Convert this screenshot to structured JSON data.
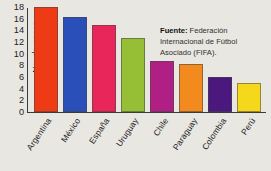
{
  "chart_data": {
    "type": "bar",
    "title": "",
    "xlabel": "",
    "ylabel": "No. de veces",
    "ylim": [
      0,
      18
    ],
    "yticks": [
      "0",
      "2",
      "4",
      "6",
      "8",
      "10",
      "12",
      "14",
      "16",
      "18"
    ],
    "grid": false,
    "legend": "none",
    "categories": [
      "Argentina",
      "México",
      "España",
      "Uruguay",
      "Chile",
      "Paraguay",
      "Colombia",
      "Perú"
    ],
    "values": [
      18,
      16.3,
      15,
      12.7,
      8.7,
      8.3,
      6,
      5
    ],
    "colors": [
      "#ef3a16",
      "#2a4fb8",
      "#e8265a",
      "#97bf35",
      "#b02084",
      "#f28a1e",
      "#4b197e",
      "#f5d81b"
    ],
    "series": [
      {
        "name": "No. de veces",
        "values": [
          18,
          16.3,
          15,
          12.7,
          8.7,
          8.3,
          6,
          5
        ]
      }
    ],
    "annotations": {
      "source_label": "Fuente:",
      "source_text": " Federación Internacional de Fútbol Asociado (FIFA)."
    }
  },
  "figure": {
    "background_color": "#e9e7e2",
    "axis_color": "#3a3a3a"
  }
}
